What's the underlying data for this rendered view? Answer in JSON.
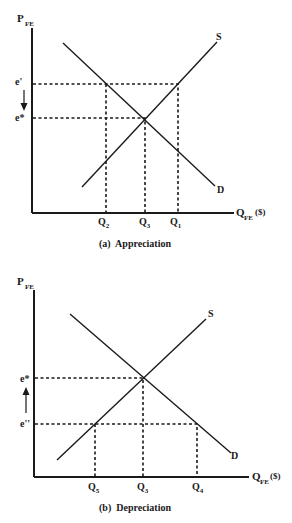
{
  "panels": [
    {
      "id": "a",
      "caption": "(a)  Appreciation",
      "y_axis_label": "P",
      "y_axis_sub": "FE",
      "x_axis_label": "Q",
      "x_axis_sub": "FE",
      "x_axis_unit": "($)",
      "supply_label": "S",
      "demand_label": "D",
      "price_levels": [
        {
          "label": "e'",
          "role": "initial price (above equilibrium)"
        },
        {
          "label": "e*",
          "role": "equilibrium price"
        }
      ],
      "arrow_direction": "down",
      "quantities": [
        {
          "label": "Q",
          "sub": "2",
          "role": "quantity demanded at e'"
        },
        {
          "label": "Q",
          "sub": "3",
          "role": "equilibrium quantity"
        },
        {
          "label": "Q",
          "sub": "1",
          "role": "quantity supplied at e'"
        }
      ]
    },
    {
      "id": "b",
      "caption": "(b)  Depreciation",
      "y_axis_label": "P",
      "y_axis_sub": "FE",
      "x_axis_label": "Q",
      "x_axis_sub": "FE",
      "x_axis_unit": "($)",
      "supply_label": "S",
      "demand_label": "D",
      "price_levels": [
        {
          "label": "e*",
          "role": "equilibrium price"
        },
        {
          "label": "e''",
          "role": "initial price (below equilibrium)"
        }
      ],
      "arrow_direction": "up",
      "quantities": [
        {
          "label": "Q",
          "sub": "5",
          "role": "quantity supplied at e''"
        },
        {
          "label": "Q",
          "sub": "3",
          "role": "equilibrium quantity"
        },
        {
          "label": "Q",
          "sub": "4",
          "role": "quantity demanded at e''"
        }
      ]
    }
  ],
  "colors": {
    "ink": "#1a1a1a",
    "background": "#ffffff"
  }
}
